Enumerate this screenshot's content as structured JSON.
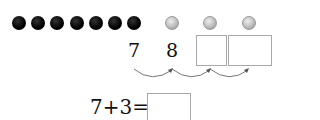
{
  "counters": {
    "filled_count": 7,
    "empty_count": 3,
    "filled_color": "#000000",
    "empty_color": "#bdbdbd"
  },
  "number_line": {
    "values": [
      "7",
      "8"
    ],
    "blank_boxes": 2,
    "hops": 3
  },
  "equation": {
    "expression": "7+3=",
    "answer": ""
  }
}
